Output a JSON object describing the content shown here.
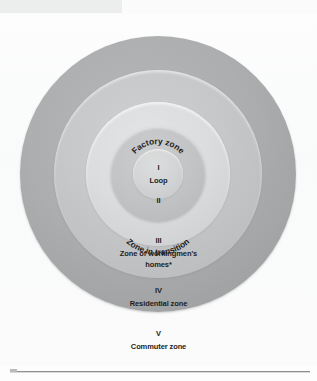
{
  "figure": {
    "zones": [
      {
        "id": "zone-1",
        "numeral": "I",
        "name": "Loop",
        "arc_label": "Factory zone",
        "color": "#d3d4d5"
      },
      {
        "id": "zone-2",
        "numeral": "II",
        "name": "",
        "arc_label": "Zone in transition",
        "color": "#c3c4c6"
      },
      {
        "id": "zone-3",
        "numeral": "III",
        "name": "Zone of workingmen's",
        "name_line2": "homes*",
        "arc_label": "",
        "color": "#dbdcdd"
      },
      {
        "id": "zone-4",
        "numeral": "IV",
        "name": "Residential zone",
        "arc_label": "",
        "color": "#c6c7c8"
      },
      {
        "id": "zone-5",
        "numeral": "V",
        "name": "Commuter zone",
        "arc_label": "",
        "color": "#adaeaf"
      }
    ]
  },
  "colors": {
    "page_background": "#fdfdfd",
    "text": "#1d1d1d",
    "rule": "#8e9092"
  }
}
